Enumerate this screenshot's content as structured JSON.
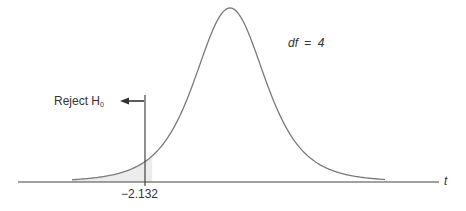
{
  "chart_data": {
    "type": "area",
    "title": "",
    "distribution": "Student t",
    "df_label_var": "df",
    "df_label_eq": "=",
    "df_value": "4",
    "xlabel": "t",
    "ylabel": "",
    "critical_value": -2.132,
    "critical_value_label": "−2.132",
    "reject_label": "Reject H",
    "reject_subscript": "0",
    "shaded_region": "left tail, t < -2.132",
    "tail": "one-tailed (left)",
    "grid": false,
    "legend": "none",
    "colors": {
      "curve": "#7a7a7a",
      "axis": "#444444",
      "shade": "#ececec",
      "text": "#333333"
    }
  }
}
